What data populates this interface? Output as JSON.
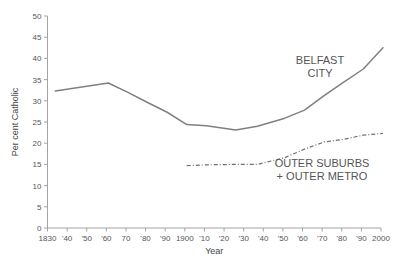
{
  "chart_data": {
    "type": "line",
    "title": "",
    "xlabel": "Year",
    "ylabel": "Per cent Catholic",
    "xlim": [
      1830,
      2000
    ],
    "ylim": [
      0,
      50
    ],
    "grid": false,
    "legend_position": "inline-annotation",
    "y_ticks": [
      0,
      5,
      10,
      15,
      20,
      25,
      30,
      35,
      40,
      45,
      50
    ],
    "y_tick_labels": [
      "0",
      "5",
      "10",
      "15",
      "20",
      "25",
      "30",
      "35",
      "40",
      "45",
      "50"
    ],
    "x_ticks": [
      1830,
      1840,
      1850,
      1860,
      1870,
      1880,
      1890,
      1900,
      1910,
      1920,
      1930,
      1940,
      1950,
      1960,
      1970,
      1980,
      1990,
      2000
    ],
    "x_tick_labels": [
      "1830",
      "'40",
      "'50",
      "'60",
      "70",
      "'80",
      "'90",
      "1900",
      "'10",
      "'20",
      "'30",
      "'40",
      "'50",
      "'60",
      "'70",
      "'80",
      "'90",
      "2000"
    ],
    "series": [
      {
        "name": "BELFAST CITY",
        "style": "solid",
        "color": "#808080",
        "label_lines": [
          "BELFAST",
          "CITY"
        ],
        "x": [
          1834,
          1861,
          1871,
          1881,
          1891,
          1901,
          1911,
          1926,
          1937,
          1951,
          1961,
          1971,
          1981,
          1991,
          2001
        ],
        "values": [
          32.3,
          34.2,
          32.0,
          29.6,
          27.3,
          24.4,
          24.1,
          23.1,
          24.0,
          25.9,
          27.8,
          31.2,
          34.4,
          37.5,
          42.5
        ]
      },
      {
        "name": "OUTER SUBURBS + OUTER METRO",
        "style": "dash-dot",
        "color": "#707070",
        "label_lines": [
          "OUTER SUBURBS",
          "+ OUTER METRO"
        ],
        "x": [
          1901,
          1911,
          1926,
          1937,
          1951,
          1961,
          1971,
          1981,
          1991,
          2001
        ],
        "values": [
          14.7,
          14.9,
          15.0,
          15.0,
          16.6,
          18.6,
          20.3,
          20.9,
          21.9,
          22.3
        ]
      }
    ]
  },
  "colors": {
    "background": "#ffffff",
    "axis": "#9a9a9a",
    "text": "#555555",
    "belfast_line": "#808080",
    "outer_line": "#707070"
  }
}
